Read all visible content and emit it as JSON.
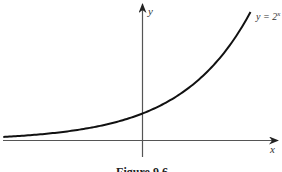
{
  "chart_data": {
    "type": "line",
    "title": "",
    "caption": "Figure 9.6",
    "xlabel": "x",
    "ylabel": "y",
    "series": [
      {
        "name": "y = 2^x",
        "label": "y = 2",
        "label_superscript": "x",
        "x": [
          -2.9,
          -2.5,
          -2,
          -1.5,
          -1,
          -0.5,
          0,
          0.5,
          1,
          1.5,
          2,
          2.25
        ],
        "values": [
          0.134,
          0.177,
          0.25,
          0.354,
          0.5,
          0.707,
          1,
          1.414,
          2,
          2.828,
          4,
          4.757
        ]
      }
    ],
    "xlim": [
      -2.95,
      2.8
    ],
    "ylim": [
      -0.65,
      5
    ],
    "grid": false,
    "legend": "inline label near curve end (top-right)",
    "colors": {
      "curve": "#111111",
      "axes": "#555555"
    }
  }
}
